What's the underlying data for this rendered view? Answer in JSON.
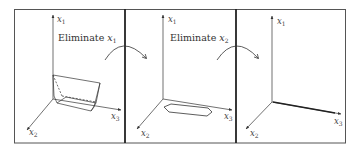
{
  "figure": {
    "panels": [
      {
        "id": "panel-1",
        "caption": "Eliminate",
        "caption_var": "x",
        "caption_sub": "1",
        "axes": {
          "x1": {
            "var": "x",
            "sub": "1"
          },
          "x2": {
            "var": "x",
            "sub": "2"
          },
          "x3": {
            "var": "x",
            "sub": "3"
          }
        },
        "shape": "3D polytope (truncated prism)"
      },
      {
        "id": "panel-2",
        "caption": "Eliminate",
        "caption_var": "x",
        "caption_sub": "2",
        "axes": {
          "x1": {
            "var": "x",
            "sub": "1"
          },
          "x2": {
            "var": "x",
            "sub": "2"
          },
          "x3": {
            "var": "x",
            "sub": "3"
          }
        },
        "shape": "2D polygon (hexagon) in x2-x3 plane"
      },
      {
        "id": "panel-3",
        "axes": {
          "x1": {
            "var": "x",
            "sub": "1"
          },
          "x2": {
            "var": "x",
            "sub": "2"
          },
          "x3": {
            "var": "x",
            "sub": "3"
          }
        },
        "shape": "1D interval on x3 axis"
      }
    ],
    "colors": {
      "border": "#444444",
      "divider": "#222222",
      "line": "#333333",
      "background": "#ffffff"
    }
  }
}
